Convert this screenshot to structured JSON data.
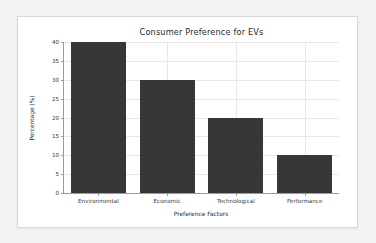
{
  "chart_data": {
    "type": "bar",
    "title": "Consumer Preference for EVs",
    "xlabel": "Preference Factors",
    "ylabel": "Percentage (%)",
    "categories": [
      "Environmental",
      "Economic",
      "Technological",
      "Performance"
    ],
    "values": [
      40,
      30,
      20,
      10
    ],
    "ylim": [
      0,
      40
    ],
    "yticks": [
      0,
      5,
      10,
      15,
      20,
      25,
      30,
      35,
      40
    ],
    "ytick_labels": [
      "0",
      "5",
      "10",
      "15",
      "20",
      "25",
      "30",
      "35",
      "40"
    ],
    "grid": true,
    "legend": null,
    "bar_color": "#373737",
    "grid_color": "#e8e8e8",
    "axis_color": "#9a9a9a"
  },
  "figure": {
    "background": "#ffffff",
    "page_background": "#f2f2f2"
  }
}
